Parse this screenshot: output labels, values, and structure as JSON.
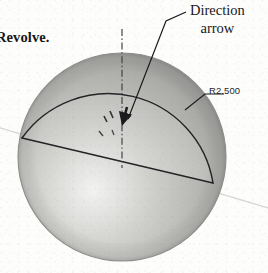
{
  "figure": {
    "type": "cad-revolve-illustration",
    "caption_fragment": "Revolve.",
    "background_color": "#fdfdfc"
  },
  "callout": {
    "line1": "Direction",
    "line2": "arrow",
    "target": "direction-arrow-at-axis"
  },
  "dimension": {
    "label": "R2.500",
    "value": 2.5,
    "symbol": "R",
    "applies_to": "profile-arc"
  },
  "geometry": {
    "sphere": {
      "center_x": 122,
      "center_y": 157,
      "radius": 104,
      "fill_light": "#e9e9e7",
      "fill_mid": "#bdbdba",
      "fill_dark": "#8f8f8d",
      "outline_color": "#8d8d8b"
    },
    "axis": {
      "name": "axis-of-revolution",
      "style": "dash-dot",
      "color": "#3a3a3c",
      "x": 122,
      "y_top": 29,
      "y_bottom": 168
    },
    "profile": {
      "name": "revolve-profile",
      "arc_radius_label": "R2.500",
      "chord_color": "#232325",
      "arc_color": "#232325"
    },
    "ground_line": {
      "name": "construction-axis-line",
      "color": "#d2d2d0"
    },
    "direction_arrow": {
      "name": "direction-arrow",
      "points": "down",
      "color": "#1b1b1d"
    }
  },
  "colors": {
    "ink": "#17171a",
    "line": "#232325",
    "faint_line": "#d2d2d0",
    "sphere_outline": "#8d8d8b"
  }
}
